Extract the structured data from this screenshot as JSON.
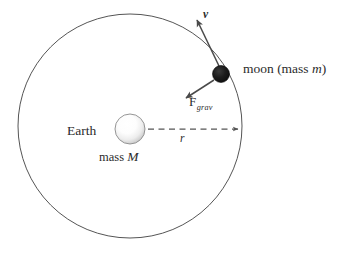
{
  "diagram": {
    "background_color": "#ffffff",
    "stroke_color": "#4a4a4a",
    "text_color": "#2b2b2b",
    "labels": {
      "earth": "Earth",
      "earth_mass_prefix": "mass ",
      "earth_mass_symbol": "M",
      "moon_prefix": "moon (mass ",
      "moon_symbol": "m",
      "moon_suffix": ")",
      "velocity": "v",
      "force_base": "F",
      "force_subscript": "grav",
      "radius": "r"
    },
    "geometry": {
      "orbit_center_x": 130,
      "orbit_center_y": 126,
      "orbit_radius": 112,
      "earth_center_x": 130,
      "earth_center_y": 129,
      "earth_radius": 15,
      "moon_center_x": 221,
      "moon_center_y": 74,
      "moon_radius": 8.5,
      "radius_arrow_from_x": 148,
      "radius_arrow_to_x": 240,
      "radius_arrow_y": 129,
      "velocity_arrow_tip_x": 196,
      "velocity_arrow_tip_y": 17,
      "force_arrow_tip_x": 184,
      "force_arrow_tip_y": 99
    },
    "colors": {
      "orbit_line": "#555555",
      "moon_fill": "#111111",
      "earth_edge": "#8a8a8a",
      "earth_highlight": "#ffffff",
      "arrow": "#4a4a4a",
      "dashed_line": "#555555"
    }
  }
}
